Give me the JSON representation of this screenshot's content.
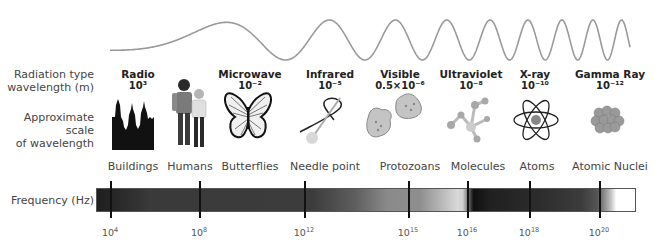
{
  "row_labels": {
    "radiation_type": "Radiation type",
    "wavelength": "wavelength (m)",
    "scale_line1": "Approximate scale",
    "scale_line2": "of wavelength",
    "frequency": "Frequency (Hz)"
  },
  "bands": [
    {
      "name": "Radio",
      "wavelength": "10³",
      "object": "Buildings",
      "icon": "buildings-icon"
    },
    {
      "name": "",
      "wavelength": "",
      "object": "Humans",
      "icon": "humans-icon"
    },
    {
      "name": "Microwave",
      "wavelength": "10⁻²",
      "object": "Butterflies",
      "icon": "butterfly-icon"
    },
    {
      "name": "Infrared",
      "wavelength": "10⁻⁵",
      "object": "Needle point",
      "icon": "needle-icon"
    },
    {
      "name": "Visible",
      "wavelength": "0.5×10⁻⁶",
      "object": "Protozoans",
      "icon": "protozoan-icon"
    },
    {
      "name": "Ultraviolet",
      "wavelength": "10⁻⁸",
      "object": "Molecules",
      "icon": "molecule-icon"
    },
    {
      "name": "X-ray",
      "wavelength": "10⁻¹⁰",
      "object": "Atoms",
      "icon": "atom-icon"
    },
    {
      "name": "Gamma Ray",
      "wavelength": "10⁻¹²",
      "object": "Atomic Nuclei",
      "icon": "nucleus-icon"
    }
  ],
  "frequency_ticks": [
    {
      "base": "10",
      "exp": "4"
    },
    {
      "base": "10",
      "exp": "8"
    },
    {
      "base": "10",
      "exp": "12"
    },
    {
      "base": "10",
      "exp": "15"
    },
    {
      "base": "10",
      "exp": "16"
    },
    {
      "base": "10",
      "exp": "18"
    },
    {
      "base": "10",
      "exp": "20"
    }
  ],
  "colors": {
    "wave": "#9a9a9a",
    "bar_dark": "#1e1e1e",
    "bar_light": "#ffffff",
    "text": "#333333"
  }
}
